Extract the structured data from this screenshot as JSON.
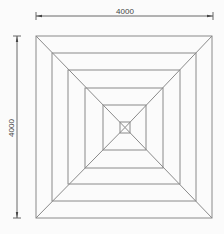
{
  "drawing": {
    "title": "Nested square plan drawing",
    "line_color": "#8a8a8a",
    "dim_color": "#333333",
    "dimensions": {
      "width_label": "4000",
      "height_label": "4000"
    },
    "squares": [
      {
        "x1": 36,
        "y1": 36,
        "x2": 212,
        "y2": 218
      },
      {
        "x1": 52,
        "y1": 53,
        "x2": 196,
        "y2": 201
      },
      {
        "x1": 68,
        "y1": 70,
        "x2": 180,
        "y2": 184
      },
      {
        "x1": 85,
        "y1": 88,
        "x2": 163,
        "y2": 168
      },
      {
        "x1": 103,
        "y1": 105,
        "x2": 146,
        "y2": 150
      },
      {
        "x1": 120,
        "y1": 122,
        "x2": 130,
        "y2": 133
      }
    ]
  }
}
